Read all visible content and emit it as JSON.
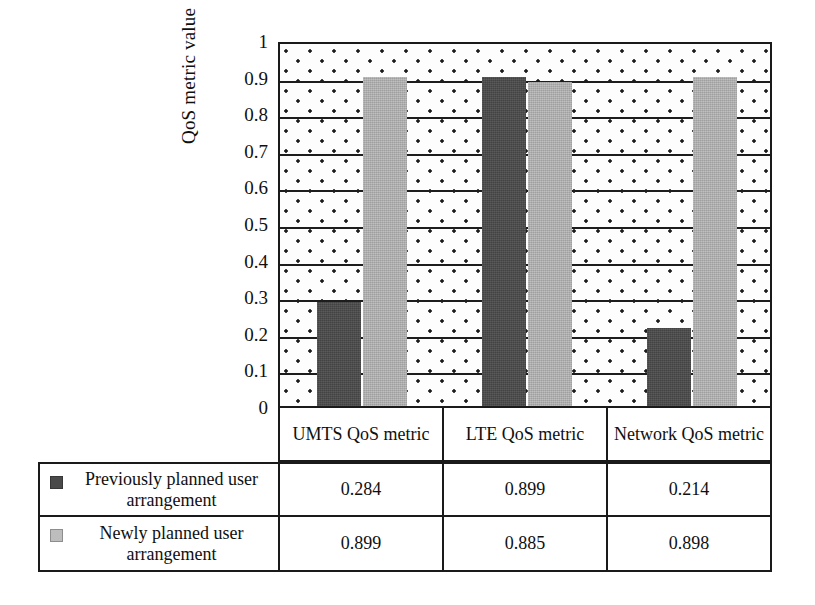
{
  "chart_data": {
    "type": "bar",
    "title": "",
    "xlabel": "",
    "ylabel": "QoS metric value",
    "ylim": [
      0,
      1
    ],
    "ytick_labels": [
      "1",
      "0.9",
      "0.8",
      "0.7",
      "0.6",
      "0.5",
      "0.4",
      "0.3",
      "0.2",
      "0.1",
      "0"
    ],
    "ytick_values": [
      1,
      0.9,
      0.8,
      0.7,
      0.6,
      0.5,
      0.4,
      0.3,
      0.2,
      0.1,
      0
    ],
    "grid": true,
    "grid_orientation": "horizontal",
    "legend_position": "table-below",
    "categories": [
      "UMTS QoS metric",
      "LTE QoS metric",
      "Network QoS metric"
    ],
    "series": [
      {
        "name": "Previously planned user arrangement",
        "color": "#4a4a4a",
        "values": [
          0.284,
          0.899,
          0.214
        ],
        "value_labels": [
          "0.284",
          "0.899",
          "0.214"
        ]
      },
      {
        "name": "Newly planned user arrangement",
        "color": "#b2b2b2",
        "values": [
          0.899,
          0.885,
          0.898
        ],
        "value_labels": [
          "0.899",
          "0.885",
          "0.898"
        ]
      }
    ]
  },
  "axis": {
    "y_title": "QoS metric value",
    "ticks": [
      "1",
      "0.9",
      "0.8",
      "0.7",
      "0.6",
      "0.5",
      "0.4",
      "0.3",
      "0.2",
      "0.1",
      "0"
    ]
  },
  "categories": [
    {
      "label": "UMTS QoS metric"
    },
    {
      "label": "LTE QoS metric"
    },
    {
      "label": "Network QoS metric"
    }
  ],
  "table": {
    "rows": [
      {
        "legend": "Previously planned user arrangement",
        "swatch_color": "#4a4a4a",
        "values": [
          "0.284",
          "0.899",
          "0.214"
        ]
      },
      {
        "legend": "Newly planned user arrangement",
        "swatch_color": "#bdbdbd",
        "values": [
          "0.899",
          "0.885",
          "0.898"
        ]
      }
    ]
  },
  "colors": {
    "series_previous": "#4a4a4a",
    "series_new": "#b2b2b2",
    "axis_line": "#1a1a1a",
    "background": "#ffffff"
  }
}
